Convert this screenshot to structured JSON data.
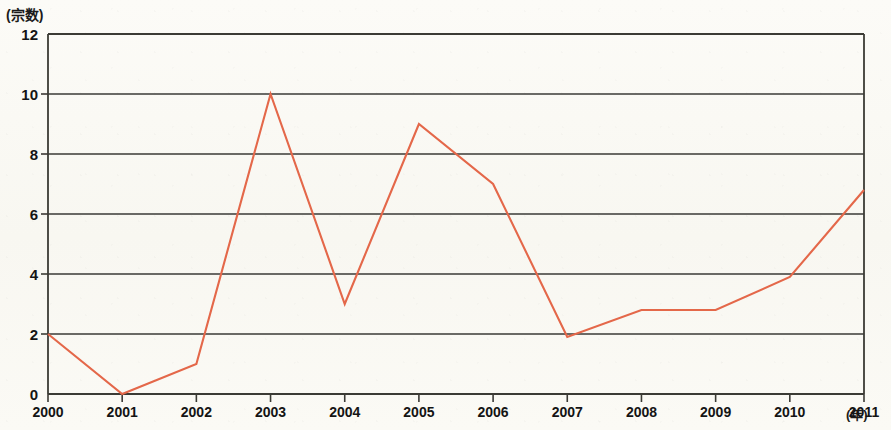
{
  "chart_data": {
    "type": "line",
    "title": "",
    "subtitle": "",
    "xlabel": "(年)",
    "ylabel": "(宗数)",
    "categories": [
      "2000",
      "2001",
      "2002",
      "2003",
      "2004",
      "2005",
      "2006",
      "2007",
      "2008",
      "2009",
      "2010",
      "2011"
    ],
    "x": [
      2000,
      2001,
      2002,
      2003,
      2004,
      2005,
      2006,
      2007,
      2008,
      2009,
      2010,
      2011
    ],
    "values": [
      2,
      0,
      1,
      10,
      3,
      9,
      7,
      1.9,
      2.8,
      2.8,
      3.9,
      6.8
    ],
    "series": [
      {
        "name": "宗数",
        "values": [
          2,
          0,
          1,
          10,
          3,
          9,
          7,
          1.9,
          2.8,
          2.8,
          3.9,
          6.8
        ]
      }
    ],
    "ylim": [
      0,
      12
    ],
    "yticks": [
      0,
      2,
      4,
      6,
      8,
      10,
      12
    ],
    "ytick_labels": [
      "0",
      "2",
      "4",
      "6",
      "8",
      "10",
      "12"
    ],
    "xtick_labels": [
      "2000",
      "2001",
      "2002",
      "2003",
      "2004",
      "2005",
      "2006",
      "2007",
      "2008",
      "2009",
      "2010",
      "2011"
    ],
    "grid": true,
    "grid_axis": "y",
    "legend": false,
    "legend_position": "none",
    "line_color": "#e4674a",
    "grid_color": "#3b3a36",
    "axis_color": "#3b3a36",
    "background_color": "#fbfaf6",
    "markers": false
  },
  "axes": {
    "y_unit_label": "(宗数)",
    "x_unit_label": "(年)"
  }
}
